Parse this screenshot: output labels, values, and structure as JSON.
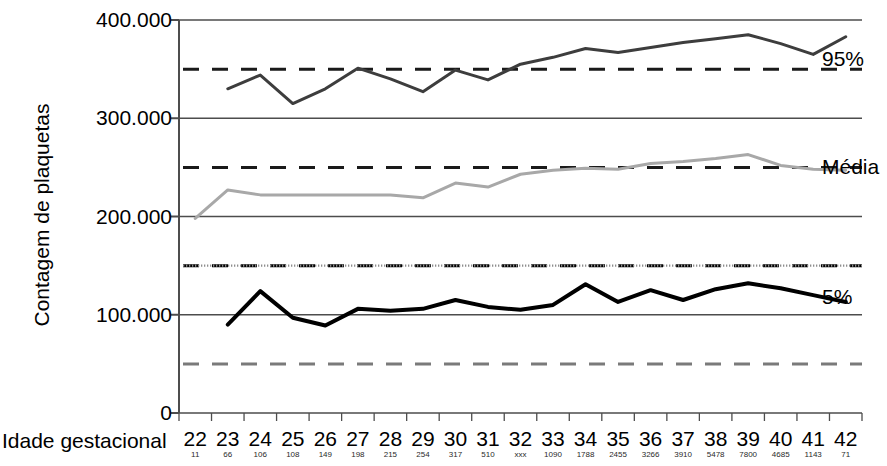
{
  "chart_data": {
    "type": "line",
    "title": "",
    "xlabel": "Idade gestacional",
    "ylabel": "Contagem de plaquetas",
    "x": [
      22,
      23,
      24,
      25,
      26,
      27,
      28,
      29,
      30,
      31,
      32,
      33,
      34,
      35,
      36,
      37,
      38,
      39,
      40,
      41,
      42
    ],
    "xtick_labels": [
      "22",
      "23",
      "24",
      "25",
      "26",
      "27",
      "28",
      "29",
      "30",
      "31",
      "32",
      "33",
      "34",
      "35",
      "36",
      "37",
      "38",
      "39",
      "40",
      "41",
      "42"
    ],
    "xlim": [
      21.5,
      42.5
    ],
    "ylim": [
      0,
      400000
    ],
    "ytick_labels": [
      "0",
      "100.000",
      "200.000",
      "300.000",
      "400.000"
    ],
    "ytick_values": [
      0,
      100000,
      200000,
      300000,
      400000
    ],
    "grid": true,
    "grid_axis": "y",
    "legend_position": "right-inline",
    "sample_counts_label": "",
    "sample_counts": [
      "11",
      "66",
      "106",
      "108",
      "149",
      "198",
      "215",
      "254",
      "317",
      "510",
      "xxx",
      "1090",
      "1788",
      "2455",
      "3266",
      "3910",
      "5478",
      "7800",
      "4685",
      "1143",
      "71"
    ],
    "series": [
      {
        "name": "95%",
        "color": "#3d3d3d",
        "width": 3,
        "style": "solid",
        "x": [
          23,
          24,
          25,
          26,
          27,
          28,
          29,
          30,
          31,
          32,
          33,
          34,
          35,
          36,
          37,
          38,
          39,
          40,
          41,
          42
        ],
        "values": [
          330000,
          344000,
          315000,
          330000,
          351000,
          340000,
          327000,
          349000,
          339000,
          355000,
          362000,
          371000,
          367000,
          372000,
          377000,
          381000,
          385000,
          376000,
          365000,
          383000
        ]
      },
      {
        "name": "Média",
        "color": "#a8a8a8",
        "width": 3,
        "style": "solid",
        "x": [
          22,
          23,
          24,
          25,
          26,
          27,
          28,
          29,
          30,
          31,
          32,
          33,
          34,
          35,
          36,
          37,
          38,
          39,
          40,
          41,
          42
        ],
        "values": [
          198000,
          227000,
          222000,
          222000,
          222000,
          222000,
          222000,
          219000,
          234000,
          230000,
          243000,
          247000,
          249000,
          248000,
          254000,
          256000,
          259000,
          263000,
          252000,
          248000,
          247000
        ]
      },
      {
        "name": "5%",
        "color": "#000000",
        "width": 4,
        "style": "solid",
        "x": [
          23,
          24,
          25,
          26,
          27,
          28,
          29,
          30,
          31,
          32,
          33,
          34,
          35,
          36,
          37,
          38,
          39,
          40,
          41,
          42
        ],
        "values": [
          90000,
          124000,
          97000,
          89000,
          106000,
          104000,
          106000,
          115000,
          108000,
          105000,
          110000,
          131000,
          113000,
          125000,
          115000,
          126000,
          132000,
          127000,
          120000,
          113000
        ]
      }
    ],
    "reference_lines": [
      {
        "name": "upper-dashed-350k",
        "value": 350000,
        "style": "dashed",
        "color": "#1a1a1a",
        "width": 3
      },
      {
        "name": "mid-dashed-250k",
        "value": 250000,
        "style": "dashed",
        "color": "#1a1a1a",
        "width": 3
      },
      {
        "name": "threshold-dashed-150k",
        "value": 150000,
        "style": "dashed",
        "color": "#000000",
        "width": 3
      },
      {
        "name": "lower-dashed-50k",
        "value": 50000,
        "style": "dashed",
        "color": "#7a7a7a",
        "width": 3
      }
    ],
    "annotations": [
      {
        "name": "series-label-95",
        "text": "95%",
        "value": 360000
      },
      {
        "name": "series-label-media",
        "text": "Média",
        "value": 250000
      },
      {
        "name": "series-label-5",
        "text": "5%",
        "value": 118000
      }
    ]
  }
}
